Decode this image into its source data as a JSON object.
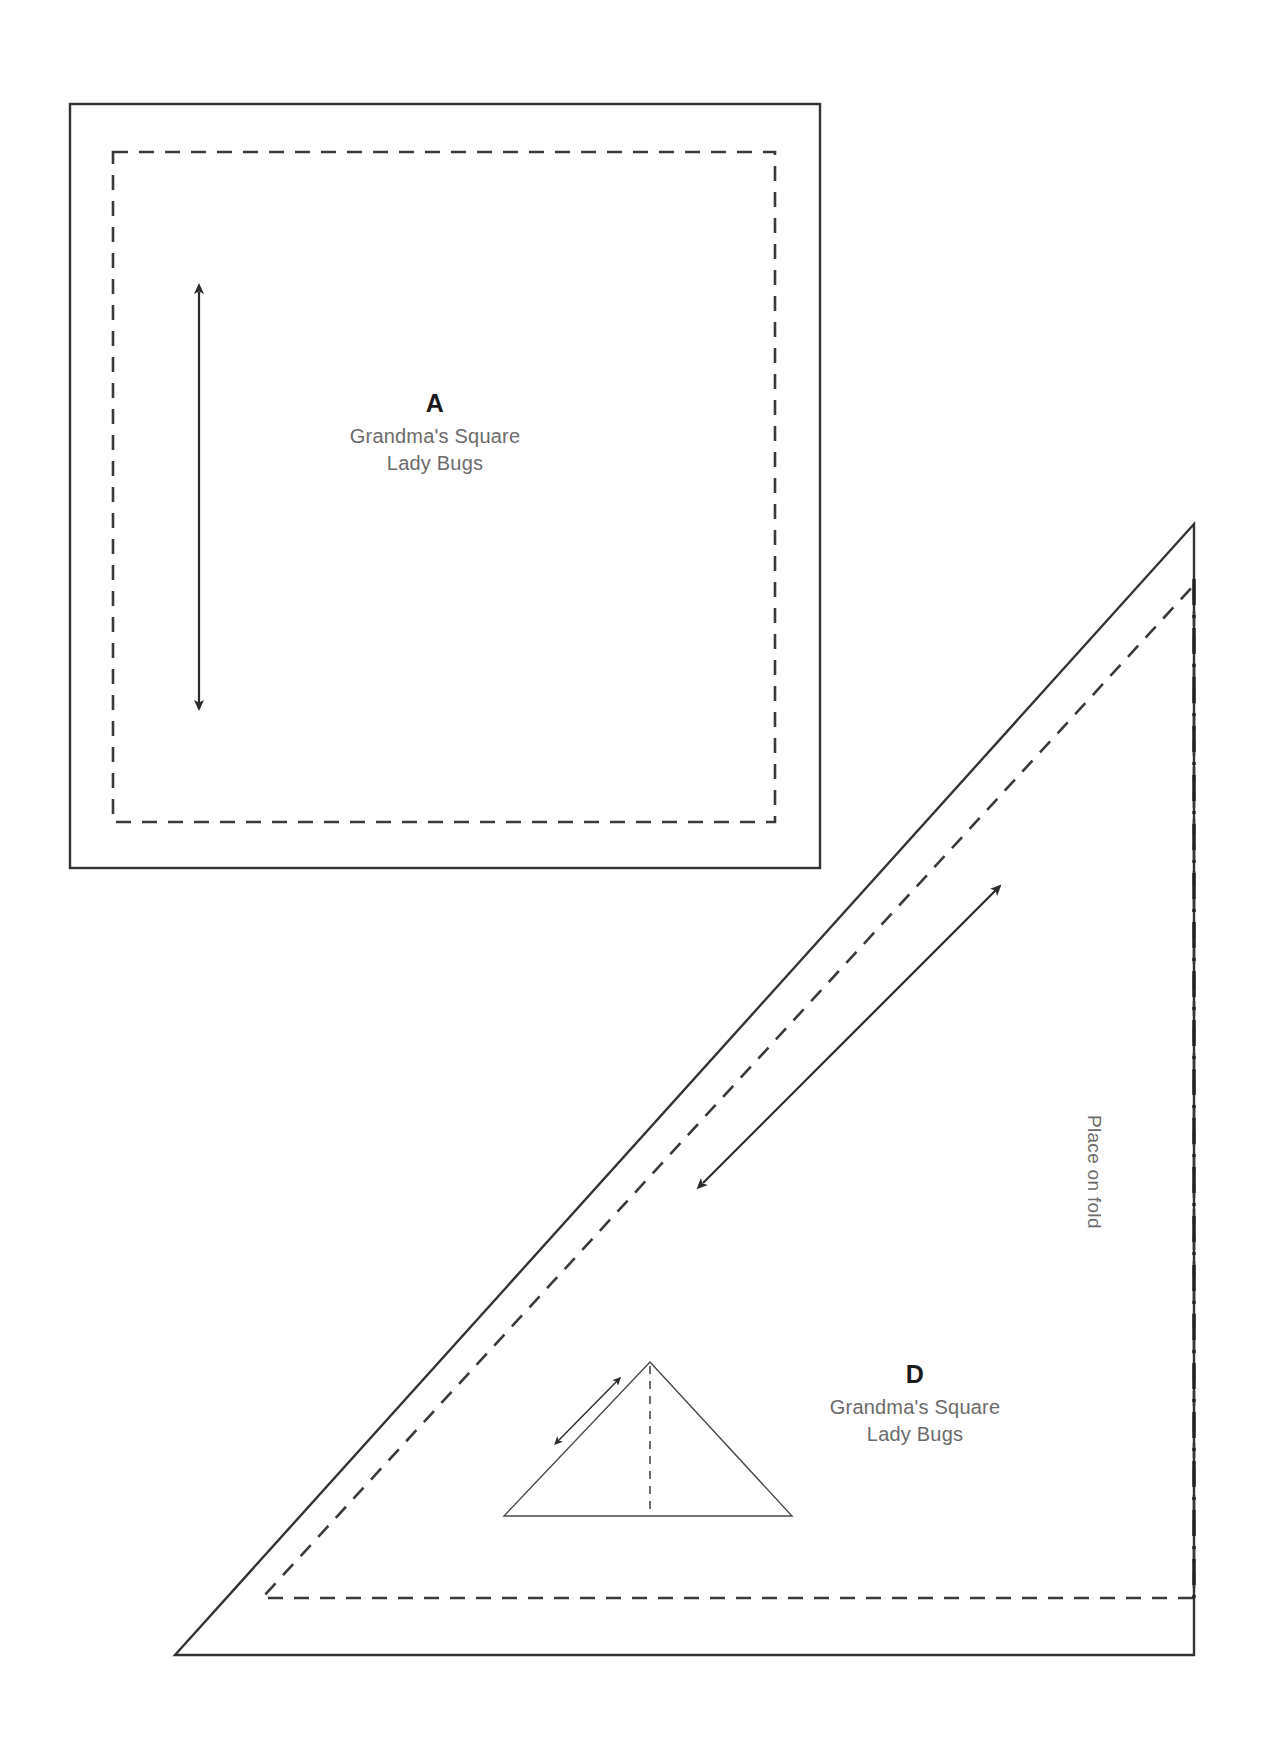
{
  "document": {
    "title": "Quilt Pattern Template Sheet",
    "background_color": "#ffffff",
    "width": 1264,
    "height": 1745
  },
  "pieces": [
    {
      "id": "piece-a",
      "letter": "A",
      "pattern_name": "Grandma's Square",
      "fabric_name": "Lady Bugs",
      "shape": "square",
      "cut_line_color": "#333333",
      "seam_line_color": "#3a3a3a"
    },
    {
      "id": "piece-d",
      "letter": "D",
      "pattern_name": "Grandma's Square",
      "fabric_name": "Lady Bugs",
      "shape": "right-triangle",
      "cut_line_color": "#333333",
      "seam_line_color": "#3a3a3a"
    }
  ],
  "annotations": {
    "place_on_fold": "Place on fold",
    "fold_line_color": "#222222",
    "grain_arrow_color": "#2b2b2b"
  }
}
